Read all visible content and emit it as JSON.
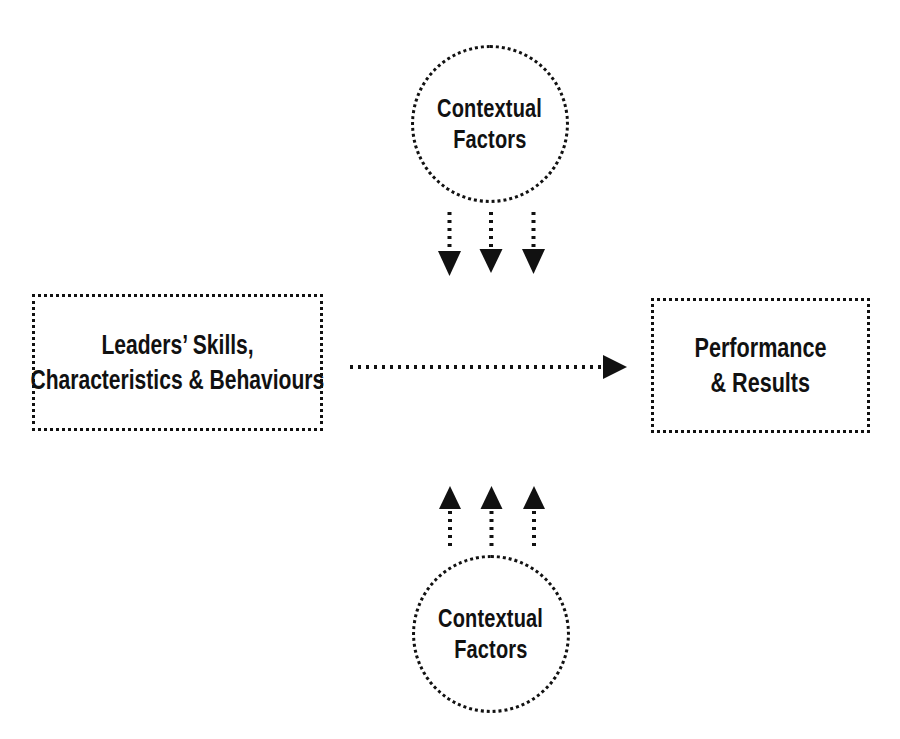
{
  "canvas": {
    "width": 900,
    "height": 739,
    "background": "#ffffff",
    "ink": "#111111"
  },
  "nodes": {
    "circle_top": {
      "label_line1": "Contextual",
      "label_line2": "Factors",
      "shape": "circle",
      "border_style": "dotted"
    },
    "circle_bottom": {
      "label_line1": "Contextual",
      "label_line2": "Factors",
      "shape": "circle",
      "border_style": "dotted"
    },
    "box_left": {
      "label_line1": "Leaders’ Skills,",
      "label_line2": "Characteristics & Behaviours",
      "shape": "rectangle",
      "border_style": "dotted"
    },
    "box_right": {
      "label_line1": "Performance",
      "label_line2": "& Results",
      "shape": "rectangle",
      "border_style": "dotted"
    }
  },
  "connectors": {
    "top_influence": {
      "name": "contextual-factors-down-arrows",
      "direction": "down",
      "count": 3,
      "style": "dotted",
      "arrowhead": "solid-triangle"
    },
    "bottom_influence": {
      "name": "contextual-factors-up-arrows",
      "direction": "up",
      "count": 3,
      "style": "dotted",
      "arrowhead": "solid-triangle"
    },
    "main_flow": {
      "name": "leaders-to-performance-arrow",
      "direction": "right",
      "count": 1,
      "style": "dotted",
      "arrowhead": "solid-triangle"
    }
  }
}
